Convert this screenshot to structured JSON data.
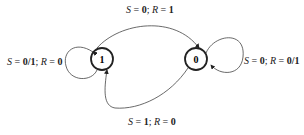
{
  "diagram": {
    "type": "state-machine",
    "states": [
      {
        "id": "state-1",
        "label": "1"
      },
      {
        "id": "state-0",
        "label": "0"
      }
    ],
    "transitions": [
      {
        "from": "1",
        "to": "1",
        "label": {
          "s": "0/1",
          "r": "0"
        }
      },
      {
        "from": "1",
        "to": "0",
        "label": {
          "s": "0",
          "r": "1"
        }
      },
      {
        "from": "0",
        "to": "0",
        "label": {
          "s": "0",
          "r": "0/1"
        }
      },
      {
        "from": "0",
        "to": "1",
        "label": {
          "s": "1",
          "r": "0"
        }
      }
    ],
    "var_s": "S",
    "var_r": "R",
    "eq": " = ",
    "sep": "; "
  }
}
